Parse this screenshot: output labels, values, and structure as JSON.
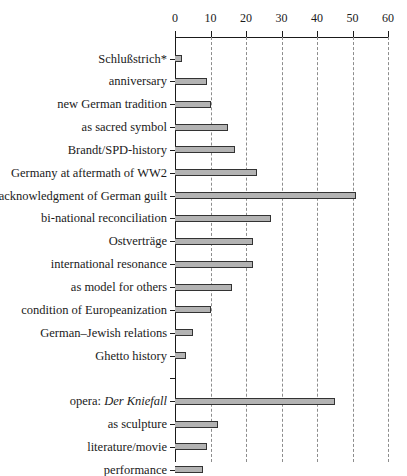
{
  "chart_data": {
    "type": "bar",
    "orientation": "horizontal",
    "title": "",
    "subtitle": "",
    "xlabel": "",
    "ylabel": "",
    "xlim": [
      0,
      60
    ],
    "xticks": [
      0,
      10,
      20,
      30,
      40,
      50,
      60
    ],
    "xtick_labels": [
      "0",
      "10",
      "20",
      "30",
      "40",
      "50",
      "60"
    ],
    "grid": "vertical-dashed",
    "legend": "none",
    "axis_position": "top",
    "bar_color": "#b3b3b3",
    "bar_edge_color": "#333333",
    "gridline_color": "#8d8d8d",
    "axis_color": "#1a1a1a",
    "categories": [
      "Schlußstrich*",
      "anniversary",
      "new German tradition",
      "as sacred symbol",
      "Brandt/SPD-history",
      "Germany at aftermath of WW2",
      "acknowledgment of German guilt",
      "bi-national reconciliation",
      "Ostverträge",
      "international resonance",
      "as model for others",
      "condition of Europeanization",
      "German–Jewish relations",
      "Ghetto history",
      "",
      "opera: Der Kniefall",
      "as sculpture",
      "literature/movie",
      "performance"
    ],
    "values": [
      2,
      9,
      10,
      15,
      17,
      23,
      51,
      27,
      22,
      22,
      16,
      10,
      5,
      3,
      0,
      45,
      12,
      9,
      8
    ],
    "annotations": [
      "* footnote marker on category Schlußstrich"
    ]
  },
  "rows": [
    {
      "label": "Schlußstrich*",
      "value": 2,
      "label_html": "Schlußstrich*"
    },
    {
      "label": "anniversary",
      "value": 9,
      "label_html": "anniversary"
    },
    {
      "label": "new German tradition",
      "value": 10,
      "label_html": "new German tradition"
    },
    {
      "label": "as sacred symbol",
      "value": 15,
      "label_html": "as sacred symbol"
    },
    {
      "label": "Brandt/SPD-history",
      "value": 17,
      "label_html": "Brandt/SPD-history"
    },
    {
      "label": "Germany at aftermath of WW2",
      "value": 23,
      "label_html": "Germany at aftermath of WW2"
    },
    {
      "label": "acknowledgment of German guilt",
      "value": 51,
      "label_html": "acknowledgment of German guilt"
    },
    {
      "label": "bi-national reconciliation",
      "value": 27,
      "label_html": "bi-national reconciliation"
    },
    {
      "label": "Ostverträge",
      "value": 22,
      "label_html": "Ostverträge"
    },
    {
      "label": "international resonance",
      "value": 22,
      "label_html": "international resonance"
    },
    {
      "label": "as model for others",
      "value": 16,
      "label_html": "as model for others"
    },
    {
      "label": "condition of Europeanization",
      "value": 10,
      "label_html": "condition of Europeanization"
    },
    {
      "label": "German–Jewish relations",
      "value": 5,
      "label_html": "German–Jewish relations"
    },
    {
      "label": "Ghetto history",
      "value": 3,
      "label_html": "Ghetto history"
    },
    {
      "label": "",
      "value": 0,
      "label_html": ""
    },
    {
      "label": "opera: Der Kniefall",
      "value": 45,
      "label_html": "opera: <span class=\"ital\">Der Kniefall</span>"
    },
    {
      "label": "as sculpture",
      "value": 12,
      "label_html": "as sculpture"
    },
    {
      "label": "literature/movie",
      "value": 9,
      "label_html": "literature/movie"
    },
    {
      "label": "performance",
      "value": 8,
      "label_html": "performance"
    }
  ]
}
